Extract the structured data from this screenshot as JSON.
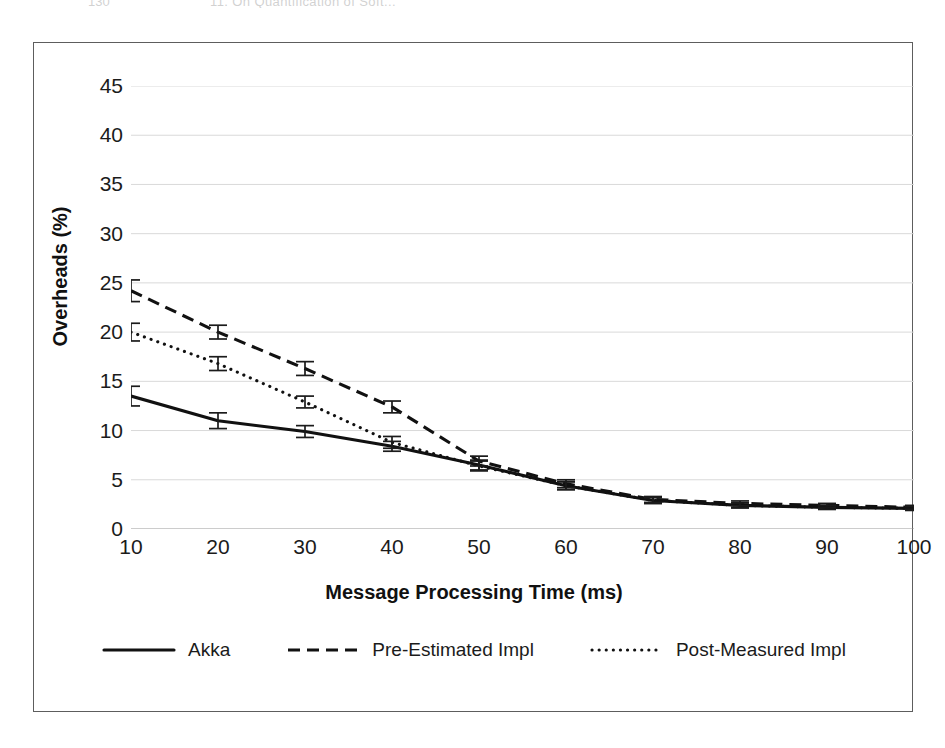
{
  "page_header": {
    "folio": "130",
    "running_title": "11. On Quantification of Soft..."
  },
  "chart_data": {
    "type": "line",
    "title": "",
    "xlabel": "Message Processing Time (ms)",
    "ylabel": "Overheads (%)",
    "x": [
      10,
      20,
      30,
      40,
      50,
      60,
      70,
      80,
      90,
      100
    ],
    "xticklabels": [
      "10",
      "20",
      "30",
      "40",
      "50",
      "60",
      "70",
      "80",
      "90",
      "100"
    ],
    "yticklabels": [
      "0",
      "5",
      "10",
      "15",
      "20",
      "25",
      "30",
      "35",
      "40",
      "45"
    ],
    "yticks": [
      0,
      5,
      10,
      15,
      20,
      25,
      30,
      35,
      40,
      45
    ],
    "xlim": [
      10,
      100
    ],
    "ylim": [
      0,
      45
    ],
    "grid": "horizontal",
    "legend_position": "bottom",
    "series": [
      {
        "name": "Akka",
        "style": "solid",
        "values": [
          13.5,
          11.0,
          9.9,
          8.4,
          6.5,
          4.4,
          2.9,
          2.4,
          2.2,
          2.1
        ],
        "errors": [
          1.0,
          0.8,
          0.6,
          0.5,
          0.5,
          0.4,
          0.3,
          0.25,
          0.2,
          0.2
        ]
      },
      {
        "name": "Pre-Estimated Impl",
        "style": "dashed",
        "values": [
          24.2,
          20.0,
          16.3,
          12.4,
          6.9,
          4.6,
          3.0,
          2.6,
          2.4,
          2.2
        ],
        "errors": [
          1.1,
          0.7,
          0.7,
          0.6,
          0.5,
          0.4,
          0.3,
          0.25,
          0.2,
          0.2
        ]
      },
      {
        "name": "Post-Measured Impl",
        "style": "dotted",
        "values": [
          20.0,
          16.8,
          12.9,
          8.8,
          6.4,
          4.4,
          2.9,
          2.4,
          2.2,
          2.1
        ],
        "errors": [
          0.9,
          0.7,
          0.6,
          0.6,
          0.5,
          0.4,
          0.3,
          0.25,
          0.2,
          0.2
        ]
      }
    ]
  },
  "colors": {
    "ink": "#111111",
    "grid": "#d9d9d9",
    "frame": "#5d5d5d",
    "background": "#ffffff"
  }
}
